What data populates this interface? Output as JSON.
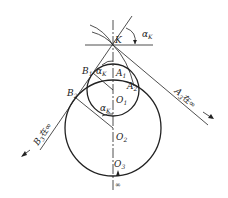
{
  "diagram": {
    "type": "involute-gear-geometry",
    "colors": {
      "stroke": "#222222",
      "background": "#ffffff"
    },
    "points": {
      "K": {
        "label": "K"
      },
      "A1": {
        "label": "A",
        "sub": "1"
      },
      "A2": {
        "label": "A",
        "sub": "2"
      },
      "B1": {
        "label": "B",
        "sub": "1"
      },
      "B2": {
        "label": "B",
        "sub": "2"
      },
      "O1": {
        "label": "O",
        "sub": "1"
      },
      "O2": {
        "label": "O",
        "sub": "2"
      },
      "O3": {
        "label": "O",
        "sub": "3"
      }
    },
    "angles": {
      "top": {
        "label": "α",
        "sub": "K"
      },
      "mid": {
        "label": "α",
        "sub": "K"
      },
      "low": {
        "label": "α",
        "sub": "K"
      }
    },
    "annotations": {
      "a_line": {
        "label": "A",
        "sub": "3",
        "suffix": "在∞"
      },
      "b_line": {
        "label": "B",
        "sub": "3",
        "suffix": "在∞"
      },
      "infinity": "∞"
    }
  }
}
